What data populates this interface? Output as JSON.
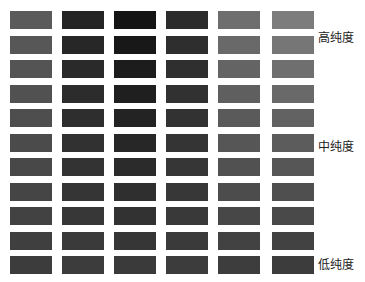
{
  "labels": {
    "high": "高纯度",
    "medium": "中纯度",
    "low": "低纯度"
  },
  "grid": {
    "rows": 11,
    "columns": 6,
    "col_x": [
      10,
      62,
      114,
      166,
      218,
      272
    ],
    "row_y": [
      11,
      36,
      60,
      85,
      109,
      134,
      158,
      183,
      207,
      232,
      256
    ],
    "swatch_w": 42,
    "swatch_h": 18,
    "top_colors": [
      "#5a5a5a",
      "#252525",
      "#141414",
      "#2c2c2c",
      "#6e6e6e",
      "#7c7c7c"
    ],
    "bottom_colors": [
      "#3c3c3c",
      "#3c3c3c",
      "#3a3a3a",
      "#3c3c3c",
      "#3d3d3d",
      "#3c3c3c"
    ]
  },
  "label_rows": {
    "high": 1,
    "medium": 5,
    "low": 10
  }
}
